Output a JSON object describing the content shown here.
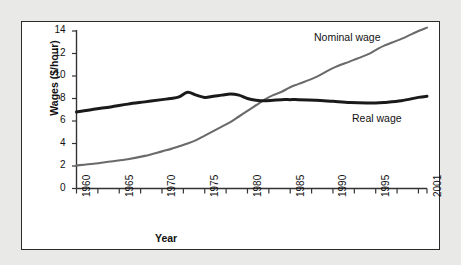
{
  "chart_data": {
    "type": "line",
    "title": "",
    "xlabel": "Year",
    "ylabel": "Wages ($/hour)",
    "xlim": [
      1960,
      2001
    ],
    "ylim": [
      0,
      14
    ],
    "yticks": [
      0,
      2,
      4,
      6,
      8,
      10,
      12,
      14
    ],
    "xticks": [
      1960,
      1965,
      1970,
      1975,
      1980,
      1985,
      1990,
      1995,
      2001
    ],
    "xtick_labels": [
      "1960",
      "1965",
      "1970",
      "1975",
      "1980",
      "1985",
      "1990",
      "1995",
      "2001"
    ],
    "ytick_labels": [
      "0",
      "2",
      "4",
      "6",
      "8",
      "10",
      "12",
      "14"
    ],
    "grid": false,
    "legend_position": "inline-annotations",
    "x": [
      1960,
      1962,
      1964,
      1966,
      1968,
      1970,
      1971,
      1972,
      1973,
      1974,
      1975,
      1976,
      1977,
      1978,
      1979,
      1980,
      1981,
      1982,
      1983,
      1984,
      1985,
      1986,
      1988,
      1990,
      1992,
      1994,
      1995,
      1996,
      1998,
      2000,
      2001
    ],
    "series": [
      {
        "name": "Nominal wage",
        "color": "#6a6a6a",
        "values": [
          2.05,
          2.2,
          2.4,
          2.6,
          2.9,
          3.3,
          3.5,
          3.75,
          4.0,
          4.3,
          4.7,
          5.1,
          5.5,
          5.9,
          6.4,
          6.9,
          7.4,
          7.9,
          8.3,
          8.6,
          9.0,
          9.3,
          9.9,
          10.7,
          11.3,
          11.9,
          12.3,
          12.7,
          13.3,
          14.0,
          14.3
        ]
      },
      {
        "name": "Real wage",
        "color": "#1a1a1a",
        "values": [
          6.8,
          7.05,
          7.25,
          7.5,
          7.7,
          7.9,
          8.0,
          8.15,
          8.55,
          8.3,
          8.1,
          8.2,
          8.3,
          8.4,
          8.3,
          8.0,
          7.85,
          7.8,
          7.85,
          7.9,
          7.9,
          7.9,
          7.85,
          7.75,
          7.65,
          7.6,
          7.6,
          7.65,
          7.8,
          8.1,
          8.2
        ]
      }
    ],
    "annotations": [
      {
        "text": "Nominal wage",
        "x": 1991,
        "y": 13.7
      },
      {
        "text": "Real wage",
        "x": 1994,
        "y": 6.6
      }
    ]
  },
  "axes": {
    "x_title": "Year",
    "y_title": "Wages ($/hour)"
  },
  "colors": {
    "background": "#e9e9e7",
    "panel": "#ffffff",
    "frame": "#2b2b2b",
    "axis": "#333333",
    "nominal": "#6a6a6a",
    "real": "#1a1a1a",
    "text": "#111111"
  }
}
